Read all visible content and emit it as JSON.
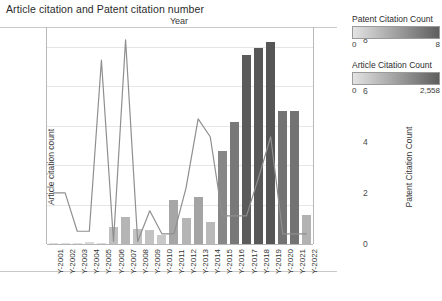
{
  "title": "Article citation and Patent citation number",
  "axes": {
    "x_title": "Year",
    "y_left_title": "Article citation count",
    "y_right_title": "Patent Citation Count"
  },
  "legend": {
    "patent": {
      "title": "Patent Citation Count",
      "min": "0",
      "max": "8",
      "color_low": "#e3e3e3",
      "color_high": "#5e5e5e"
    },
    "article": {
      "title": "Article Citation Count",
      "min": "0",
      "max": "2,558",
      "color_low": "#e3e3e3",
      "color_high": "#5e5e5e"
    }
  },
  "footnote": "",
  "chart_data": {
    "type": "bar",
    "title": "Article citation and Patent citation number",
    "xlabel": "Year",
    "ylabel": "Article citation count",
    "y2label": "Patent Citation Count",
    "ylim": [
      0,
      2750
    ],
    "y2lim": [
      0,
      8.5
    ],
    "yticks": [
      0,
      500,
      1000,
      1500,
      2000,
      2500
    ],
    "y2ticks": [
      0,
      2,
      4,
      6,
      8
    ],
    "grid": true,
    "legend_position": "right",
    "categories": [
      "Y-2001",
      "Y-2002",
      "Y-2003",
      "Y-2004",
      "Y-2005",
      "Y-2006",
      "Y-2007",
      "Y-2008",
      "Y-2009",
      "Y-2010",
      "Y-2011",
      "Y-2012",
      "Y-2013",
      "Y-2014",
      "Y-2015",
      "Y-2016",
      "Y-2017",
      "Y-2018",
      "Y-2019",
      "Y-2020",
      "Y-2021",
      "Y-2022"
    ],
    "series": [
      {
        "name": "Article Citation Count",
        "type": "bar",
        "axis": "left",
        "values": [
          8,
          6,
          4,
          22,
          15,
          210,
          340,
          195,
          175,
          120,
          560,
          330,
          600,
          285,
          1180,
          1540,
          2400,
          2480,
          2560,
          1680,
          1680,
          370
        ]
      },
      {
        "name": "Patent Citation Count",
        "type": "line",
        "axis": "right",
        "values": [
          2.0,
          2.0,
          0.5,
          0.5,
          7.2,
          0.1,
          8.0,
          0.1,
          1.3,
          0.4,
          0.4,
          2.2,
          4.9,
          4.2,
          1.1,
          1.1,
          1.1,
          2.6,
          4.2,
          0.4,
          0.4,
          0.4
        ]
      }
    ]
  }
}
